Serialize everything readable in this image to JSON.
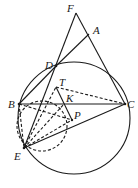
{
  "diagram": {
    "type": "geometry",
    "labels": {
      "F": "F",
      "A": "A",
      "D": "D",
      "T": "T",
      "B": "B",
      "K": "K",
      "C": "C",
      "P": "P",
      "E": "E"
    },
    "points": {
      "F": [
        76,
        13
      ],
      "A": [
        89,
        34
      ],
      "D": [
        56,
        66
      ],
      "T": [
        56,
        87
      ],
      "B": [
        19,
        104
      ],
      "K": [
        64,
        104
      ],
      "C": [
        125,
        104
      ],
      "P": [
        72,
        120
      ],
      "E": [
        24,
        148
      ]
    },
    "circles": [
      {
        "name": "circumcircle",
        "center": [
          74,
          118
        ],
        "r": 56,
        "style": "solid"
      },
      {
        "name": "small-circle",
        "center": [
          42,
          126
        ],
        "r": 25,
        "style": "dashed"
      }
    ],
    "segments_solid": [
      [
        "F",
        "C"
      ],
      [
        "F",
        "E"
      ],
      [
        "D",
        "A"
      ],
      [
        "B",
        "C"
      ],
      [
        "E",
        "C"
      ],
      [
        "B",
        "D"
      ],
      [
        "T",
        "P"
      ]
    ],
    "segments_dashed": [
      [
        "T",
        "C"
      ],
      [
        "B",
        "P"
      ],
      [
        "B",
        "E"
      ],
      [
        "E",
        "T"
      ],
      [
        "E",
        "K"
      ],
      [
        "E",
        "P"
      ]
    ],
    "colors": {
      "stroke": "#1a1a1a",
      "background": "#ffffff"
    }
  }
}
